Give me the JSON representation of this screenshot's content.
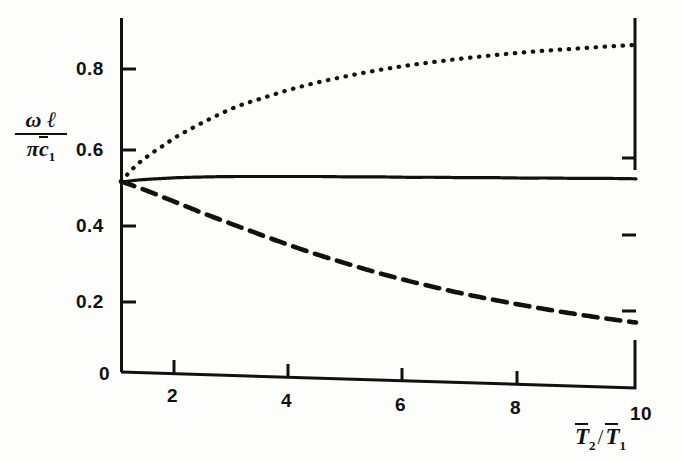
{
  "chart_data": {
    "type": "line",
    "title": "",
    "subtitle": "",
    "xlabel": "T̅2 / T̅1",
    "ylabel": "ωℓ / πc̅1",
    "xlim": [
      1,
      10
    ],
    "ylim": [
      0,
      0.92
    ],
    "grid": false,
    "legend": "none",
    "xticks": [
      "2",
      "4",
      "6",
      "8",
      "10"
    ],
    "xtick_values": [
      2,
      4,
      6,
      8,
      10
    ],
    "yticks": [
      "0",
      "0.2",
      "0.4",
      "0.6",
      "0.8"
    ],
    "ytick_values": [
      0,
      0.2,
      0.4,
      0.6,
      0.8
    ],
    "x": [
      1,
      1.25,
      1.5,
      1.75,
      2,
      2.5,
      3,
      3.5,
      4,
      4.5,
      5,
      5.5,
      6,
      6.5,
      7,
      7.5,
      8,
      8.5,
      9,
      9.5,
      10
    ],
    "series": [
      {
        "name": "upper-branch",
        "style": "dotted",
        "color": "#111111",
        "values": [
          0.505,
          0.545,
          0.575,
          0.6,
          0.625,
          0.665,
          0.7,
          0.725,
          0.748,
          0.767,
          0.783,
          0.797,
          0.809,
          0.819,
          0.828,
          0.836,
          0.843,
          0.849,
          0.854,
          0.859,
          0.863
        ]
      },
      {
        "name": "middle-branch",
        "style": "solid",
        "color": "#111111",
        "values": [
          0.503,
          0.508,
          0.511,
          0.513,
          0.515,
          0.517,
          0.518,
          0.518,
          0.518,
          0.518,
          0.517,
          0.517,
          0.516,
          0.516,
          0.515,
          0.515,
          0.514,
          0.514,
          0.513,
          0.513,
          0.512
        ]
      },
      {
        "name": "lower-branch",
        "style": "dashed",
        "color": "#111111",
        "values": [
          0.505,
          0.492,
          0.478,
          0.463,
          0.448,
          0.418,
          0.39,
          0.362,
          0.335,
          0.31,
          0.287,
          0.265,
          0.245,
          0.227,
          0.21,
          0.195,
          0.181,
          0.168,
          0.156,
          0.145,
          0.135
        ]
      }
    ]
  },
  "axis_labels": {
    "y_numerator_omega": "ω",
    "y_numerator_ell": "ℓ",
    "y_denominator_pi": "π",
    "y_denominator_c": "c",
    "y_denominator_sub": "1",
    "x_t2": "T",
    "x_t2_sub": "2",
    "x_slash": "/",
    "x_t1": "T",
    "x_t1_sub": "1"
  },
  "ticks": {
    "x": [
      {
        "label": "2",
        "px": 174
      },
      {
        "label": "4",
        "px": 288
      },
      {
        "label": "6",
        "px": 402
      },
      {
        "label": "8",
        "px": 517
      },
      {
        "label": "10",
        "px": 636
      }
    ],
    "y": [
      {
        "label": "0.8",
        "px": 69
      },
      {
        "label": "0.6",
        "px": 150
      },
      {
        "label": "0.4",
        "px": 226
      },
      {
        "label": "0.2",
        "px": 302
      },
      {
        "label": "0",
        "px": 374
      }
    ]
  },
  "colors": {
    "ink": "#111111",
    "paper": "#fdfdfc"
  }
}
